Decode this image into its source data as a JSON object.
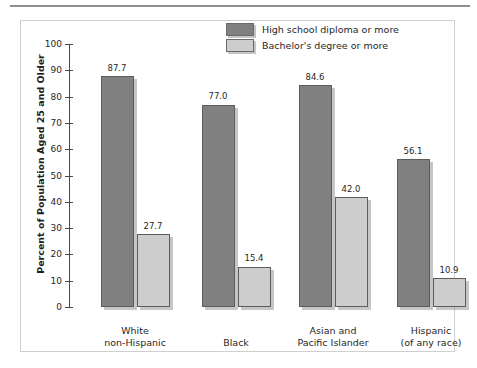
{
  "chart_data": {
    "type": "bar",
    "title": "",
    "subtitle": "",
    "xlabel": "",
    "ylabel": "Percent of Population Aged 25 and Older",
    "ylim": [
      0,
      100
    ],
    "yticks": [
      0,
      10,
      20,
      30,
      40,
      50,
      60,
      70,
      80,
      90,
      100
    ],
    "ytick_labels": [
      "0",
      "10",
      "20",
      "30",
      "40",
      "50",
      "60",
      "70",
      "80",
      "90",
      "100"
    ],
    "grid": false,
    "legend_position": "top-center",
    "categories": [
      "White\nnon-Hispanic",
      "Black",
      "Asian and\nPacific Islander",
      "Hispanic\n(of any race)"
    ],
    "category_lines": [
      [
        "White",
        "non-Hispanic"
      ],
      [
        "Black",
        ""
      ],
      [
        "Asian and",
        "Pacific Islander"
      ],
      [
        "Hispanic",
        "(of any race)"
      ]
    ],
    "series": [
      {
        "name": "High school diploma or more",
        "color": "#808080",
        "values": [
          87.7,
          77.0,
          84.6,
          56.1
        ],
        "value_labels": [
          "87.7",
          "77.0",
          "84.6",
          "56.1"
        ]
      },
      {
        "name": "Bachelor's degree or more",
        "color": "#cdcdcd",
        "values": [
          27.7,
          15.4,
          42.0,
          10.9
        ],
        "value_labels": [
          "27.7",
          "15.4",
          "42.0",
          "10.9"
        ]
      }
    ]
  },
  "legend": {
    "items": [
      {
        "label": "High school diploma or more",
        "color": "#808080"
      },
      {
        "label": "Bachelor's degree or more",
        "color": "#cdcdcd"
      }
    ]
  },
  "colors": {
    "series_dark": "#808080",
    "series_light": "#cdcdcd",
    "axis": "#4a4a4a",
    "frame_border": "#cfcfcf",
    "top_rule": "#8e8e8e",
    "text": "#1f1f1f"
  }
}
